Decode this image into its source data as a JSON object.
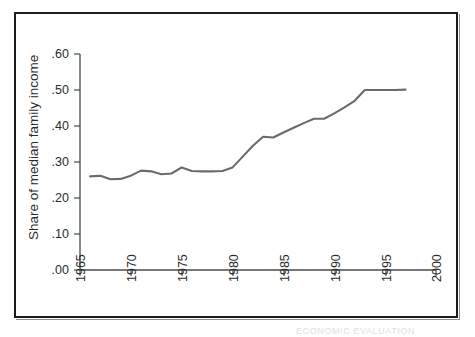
{
  "figure": {
    "frame_color": "#1c1c1c",
    "background": "#ffffff",
    "line_color": "#6b6b6b",
    "bottom_artifact_text": "ECONOMIC EVALUATION"
  },
  "chart_data": {
    "type": "line",
    "title": "",
    "xlabel": "",
    "ylabel": "Share of median family income",
    "xlim": [
      1965,
      2000
    ],
    "ylim": [
      0.0,
      0.6
    ],
    "grid": false,
    "legend": null,
    "xticks": [
      1965,
      1970,
      1975,
      1980,
      1985,
      1990,
      1995,
      2000
    ],
    "xtick_labels": [
      "1965",
      "1970",
      "1975",
      "1980",
      "1985",
      "1990",
      "1995",
      "2000"
    ],
    "yticks": [
      0.0,
      0.1,
      0.2,
      0.3,
      0.4,
      0.5,
      0.6
    ],
    "ytick_labels": [
      ".00",
      ".10",
      ".20",
      ".30",
      ".40",
      ".50",
      ".60"
    ],
    "xtick_rotation": 90,
    "series": [
      {
        "name": "Share of median family income",
        "color": "#6b6b6b",
        "x": [
          1966,
          1967,
          1968,
          1969,
          1970,
          1971,
          1972,
          1973,
          1974,
          1975,
          1976,
          1977,
          1978,
          1979,
          1980,
          1981,
          1982,
          1983,
          1984,
          1985,
          1986,
          1987,
          1988,
          1989,
          1990,
          1991,
          1992,
          1993,
          1994,
          1995,
          1996,
          1997
        ],
        "values": [
          0.26,
          0.262,
          0.252,
          0.253,
          0.262,
          0.276,
          0.274,
          0.266,
          0.268,
          0.285,
          0.275,
          0.274,
          0.274,
          0.275,
          0.285,
          0.315,
          0.345,
          0.37,
          0.368,
          0.382,
          0.395,
          0.408,
          0.42,
          0.42,
          0.435,
          0.452,
          0.47,
          0.5,
          0.5,
          0.5,
          0.5,
          0.501
        ]
      }
    ]
  }
}
